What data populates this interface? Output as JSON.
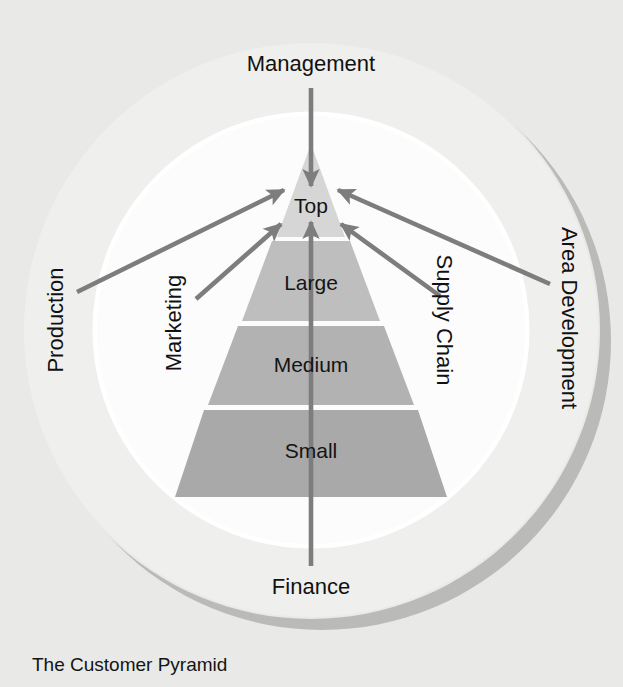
{
  "diagram": {
    "title": "The Customer Pyramid",
    "background_color": "#e9e9e7",
    "outer_circle_color": "#efefed",
    "inner_circle_color": "#fcfcfc",
    "shadow_color": "#9b9b9b",
    "arrow_color": "#7d7d7d",
    "pyramid": {
      "tiers": [
        {
          "label": "Top",
          "color": "#d6d6d6"
        },
        {
          "label": "Large",
          "color": "#bebebe"
        },
        {
          "label": "Medium",
          "color": "#b2b2b2"
        },
        {
          "label": "Small",
          "color": "#a9a9a9"
        }
      ]
    },
    "departments": [
      {
        "label": "Management",
        "position": "top",
        "orientation": "horizontal",
        "direction": "inward"
      },
      {
        "label": "Finance",
        "position": "bottom",
        "orientation": "horizontal",
        "direction": "inward"
      },
      {
        "label": "Production",
        "position": "left-outer",
        "orientation": "vertical-up",
        "direction": "inward"
      },
      {
        "label": "Marketing",
        "position": "left-inner",
        "orientation": "vertical-up",
        "direction": "inward"
      },
      {
        "label": "Supply Chain",
        "position": "right-inner",
        "orientation": "vertical-down",
        "direction": "inward"
      },
      {
        "label": "Area Development",
        "position": "right-outer",
        "orientation": "vertical-down",
        "direction": "inward"
      }
    ]
  }
}
